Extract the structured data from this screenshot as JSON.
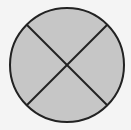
{
  "diagram": {
    "shape": "circle-divided-into-quarters",
    "parts": 4,
    "shaded_parts": 4,
    "colors": {
      "background": "#f4f4f4",
      "fill": "#c6c6c6",
      "stroke": "#222222"
    },
    "circle": {
      "cx": 67,
      "cy": 65,
      "r": 57
    },
    "dividers": [
      {
        "x1": 27,
        "y1": 25,
        "x2": 107,
        "y2": 105
      },
      {
        "x1": 107,
        "y1": 25,
        "x2": 27,
        "y2": 105
      }
    ]
  }
}
